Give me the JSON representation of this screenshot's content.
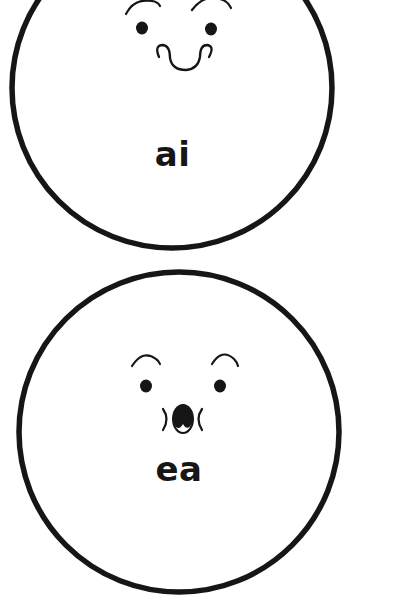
{
  "page": {
    "background_color": "#ffffff",
    "ink_color": "#161616",
    "width": 401,
    "height": 607
  },
  "cards": [
    {
      "id": "card-ai",
      "label": "ai",
      "expression": "smiling",
      "shape": "circle",
      "clipped_top": true,
      "features": {
        "eyebrows": 2,
        "eyes": 2,
        "mouth": "curled-smile"
      },
      "circle": {
        "cx": 172,
        "cy": 88,
        "r": 160,
        "stroke_width": 5.5,
        "stroke": "#161616",
        "fill": "#ffffff"
      }
    },
    {
      "id": "card-ea",
      "label": "ea",
      "expression": "surprised",
      "shape": "circle",
      "clipped_top": false,
      "features": {
        "eyebrows": 2,
        "eyes": 2,
        "mouth": "open-oval",
        "cheek_marks": 2
      },
      "circle": {
        "cx": 179,
        "cy": 432,
        "r": 160,
        "stroke_width": 5.5,
        "stroke": "#161616",
        "fill": "#ffffff"
      }
    }
  ]
}
